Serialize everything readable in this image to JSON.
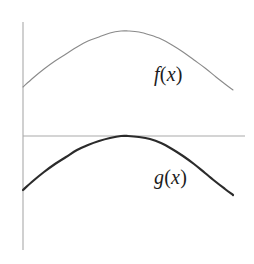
{
  "figure": {
    "background_color": "#ffffff",
    "width": 254,
    "height": 264
  },
  "axes": {
    "vertical": {
      "name": "vertical-axis",
      "color": "#a9a9a9",
      "stroke_width": 1.1,
      "x": 23,
      "y_top": 22,
      "y_bottom": 250
    },
    "horizontal": {
      "name": "horizontal-axis",
      "color": "#a9a9a9",
      "stroke_width": 1.1,
      "y": 136,
      "x_left": 23,
      "x_right": 245
    }
  },
  "labels": {
    "f": {
      "func": "f",
      "var": "x",
      "open": "(",
      "close": ")"
    },
    "g": {
      "func": "g",
      "var": "x",
      "open": "(",
      "close": ")"
    }
  },
  "chart_data": {
    "type": "line",
    "title": "",
    "xlabel": "",
    "ylabel": "",
    "grid": false,
    "legend": "inline-curve-labels",
    "axis_origin_px": [
      23,
      136
    ],
    "xlim_px": [
      23,
      245
    ],
    "ylim_px": [
      22,
      250
    ],
    "annotations": [
      {
        "text": "f(x)",
        "x_px": 154,
        "y_px": 64
      },
      {
        "text": "g(x)",
        "x_px": 154,
        "y_px": 167
      }
    ],
    "series": [
      {
        "name": "f(x)",
        "color": "#8a8a8a",
        "stroke_width": 1.1,
        "shape": "downward-parabola",
        "start_px": [
          23,
          87
        ],
        "vertex_px": [
          128,
          31
        ],
        "end_px": [
          233,
          90
        ],
        "points_px": [
          [
            23,
            87
          ],
          [
            33,
            78
          ],
          [
            44,
            69
          ],
          [
            55,
            61
          ],
          [
            66,
            54
          ],
          [
            77,
            47
          ],
          [
            88,
            41
          ],
          [
            99,
            37
          ],
          [
            110,
            33
          ],
          [
            121,
            31
          ],
          [
            128,
            31
          ],
          [
            139,
            32
          ],
          [
            150,
            35
          ],
          [
            161,
            39
          ],
          [
            172,
            45
          ],
          [
            183,
            52
          ],
          [
            194,
            60
          ],
          [
            205,
            68
          ],
          [
            216,
            77
          ],
          [
            225,
            84
          ],
          [
            233,
            90
          ]
        ]
      },
      {
        "name": "g(x)",
        "color": "#2b2b2b",
        "stroke_width": 2.2,
        "shape": "downward-parabola-tangent-to-x-axis",
        "start_px": [
          23,
          190
        ],
        "vertex_px": [
          128,
          136
        ],
        "end_px": [
          233,
          195
        ],
        "points_px": [
          [
            23,
            190
          ],
          [
            33,
            181
          ],
          [
            44,
            172
          ],
          [
            55,
            164
          ],
          [
            66,
            157
          ],
          [
            77,
            150
          ],
          [
            88,
            145
          ],
          [
            99,
            141
          ],
          [
            110,
            138
          ],
          [
            121,
            136
          ],
          [
            128,
            136
          ],
          [
            139,
            137
          ],
          [
            150,
            139
          ],
          [
            161,
            143
          ],
          [
            172,
            149
          ],
          [
            183,
            156
          ],
          [
            194,
            164
          ],
          [
            205,
            173
          ],
          [
            216,
            182
          ],
          [
            225,
            189
          ],
          [
            233,
            195
          ]
        ]
      }
    ]
  }
}
